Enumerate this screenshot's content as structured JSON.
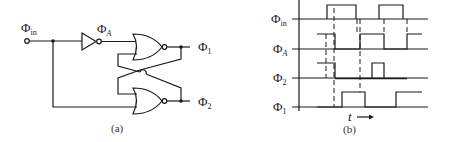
{
  "circuit": {
    "caption": "(a)",
    "input_label": "Φ",
    "input_sub": "in",
    "inverter_out_label": "Φ",
    "inverter_out_sub": "A",
    "output1_label": "Φ",
    "output1_sub": "1",
    "output2_label": "Φ",
    "output2_sub": "2",
    "components": [
      "inverter",
      "NOR gate (top)",
      "NOR gate (bottom)"
    ]
  },
  "timing": {
    "caption": "(b)",
    "time_label": "t",
    "signals": [
      {
        "name": "Φ",
        "sub": "in"
      },
      {
        "name": "Φ",
        "sub": "A"
      },
      {
        "name": "Φ",
        "sub": "2"
      },
      {
        "name": "Φ",
        "sub": "1"
      }
    ]
  },
  "colors": {
    "stroke": "#1a1a1a",
    "background": "#ffffff"
  }
}
